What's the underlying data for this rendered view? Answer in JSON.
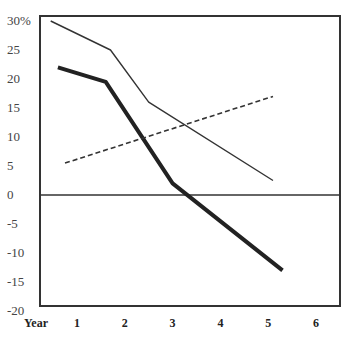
{
  "chart_data": {
    "type": "line",
    "title": "",
    "xlabel": "Year",
    "ylabel": "",
    "x_ticks": [
      "1",
      "2",
      "3",
      "4",
      "5",
      "6"
    ],
    "y_ticks": [
      "30%",
      "25",
      "20",
      "15",
      "10",
      "5",
      "0",
      "-5",
      "-10",
      "-15",
      "-20"
    ],
    "xlim": [
      0.3,
      6.5
    ],
    "ylim": [
      -20,
      31
    ],
    "grid": false,
    "legend": "none",
    "series": [
      {
        "name": "thin-solid",
        "style": "solid-thin",
        "color": "#333333",
        "points": [
          [
            0.45,
            30
          ],
          [
            1.7,
            25
          ],
          [
            2.5,
            16
          ],
          [
            5.1,
            2.5
          ]
        ]
      },
      {
        "name": "thick-solid",
        "style": "solid-thick",
        "color": "#222222",
        "points": [
          [
            0.6,
            22
          ],
          [
            1.6,
            19.5
          ],
          [
            3.0,
            2
          ],
          [
            5.3,
            -13
          ]
        ]
      },
      {
        "name": "dashed",
        "style": "dashed",
        "color": "#333333",
        "points": [
          [
            0.75,
            5.5
          ],
          [
            5.1,
            17
          ]
        ]
      }
    ],
    "reference_lines": [
      {
        "axis": "y",
        "value": 0
      }
    ]
  }
}
